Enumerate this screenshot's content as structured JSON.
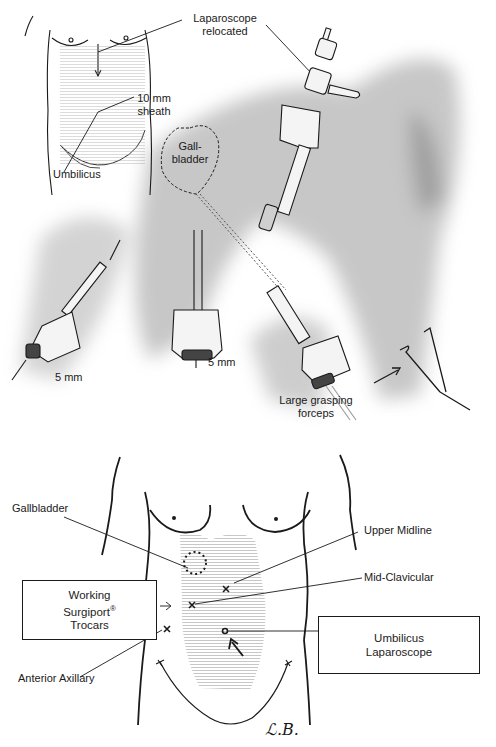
{
  "top_figure": {
    "labels": {
      "laparoscope_relocated_1": "Laparoscope",
      "laparoscope_relocated_2": "relocated",
      "sheath_1": "10 mm",
      "sheath_2": "sheath",
      "umbilicus": "Umbilicus",
      "gallbladder_1": "Gall-",
      "gallbladder_2": "bladder",
      "port_left": "5 mm",
      "port_center": "5 mm",
      "forceps_1": "Large grasping",
      "forceps_2": "forceps"
    }
  },
  "bottom_figure": {
    "labels": {
      "gallbladder": "Gallbladder",
      "upper_midline": "Upper Midline",
      "mid_clavicular": "Mid-Clavicular",
      "anterior_axillary": "Anterior Axillary",
      "signature": "ℒ.B."
    },
    "boxes": {
      "working_line1": "Working",
      "working_line2": "Surgiport",
      "working_reg": "®",
      "working_line3": "Trocars",
      "umbilicus_line1": "Umbilicus",
      "umbilicus_line2": "Laparoscope"
    }
  },
  "colors": {
    "ink": "#1a1a1a",
    "shading": "#8a8a8a",
    "paper": "#ffffff"
  }
}
